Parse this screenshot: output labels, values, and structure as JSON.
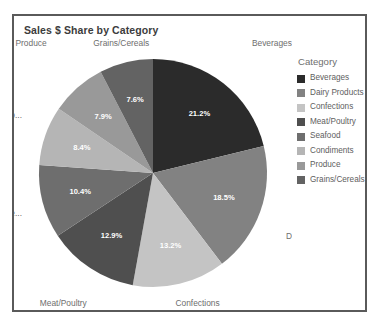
{
  "chart_title": "Sales $ Share by Category",
  "legend": {
    "title": "Category",
    "items": [
      {
        "label": "Beverages",
        "color": "#2b2b2b"
      },
      {
        "label": "Dairy Products",
        "color": "#828282"
      },
      {
        "label": "Confections",
        "color": "#c4c4c4"
      },
      {
        "label": "Meat/Poultry",
        "color": "#4f4f4f"
      },
      {
        "label": "Seafood",
        "color": "#6e6e6e"
      },
      {
        "label": "Condiments",
        "color": "#b5b5b5"
      },
      {
        "label": "Produce",
        "color": "#999999"
      },
      {
        "label": "Grains/Cereals",
        "color": "#636363"
      }
    ]
  },
  "outer_labels": [
    {
      "text": "Beverages"
    },
    {
      "text": "Da..."
    },
    {
      "text": "Confections"
    },
    {
      "text": "Meat/Poultry"
    },
    {
      "text": "Se..."
    },
    {
      "text": "Co..."
    },
    {
      "text": "Produce"
    },
    {
      "text": "Grains/Cereals"
    }
  ],
  "chart_data": {
    "type": "pie",
    "title": "Sales $ Share by Category",
    "legend_title": "Category",
    "legend_position": "right",
    "value_unit": "percent",
    "labels": [
      "Beverages",
      "Dairy Products",
      "Confections",
      "Meat/Poultry",
      "Seafood",
      "Condiments",
      "Produce",
      "Grains/Cereals"
    ],
    "values": [
      21.2,
      18.5,
      13.2,
      12.9,
      10.4,
      8.4,
      7.9,
      7.6
    ],
    "data_labels": [
      "21.2%",
      "18.5%",
      "13.2%",
      "12.9%",
      "10.4%",
      "8.4%",
      "7.9%",
      "7.6%"
    ],
    "colors": [
      "#2b2b2b",
      "#828282",
      "#c4c4c4",
      "#4f4f4f",
      "#6e6e6e",
      "#b5b5b5",
      "#999999",
      "#636363"
    ],
    "outer_label_text": [
      "Beverages",
      "Da...",
      "Confections",
      "Meat/Poultry",
      "Se...",
      "Co...",
      "Produce",
      "Grains/Cereals"
    ],
    "start_angle_deg": 0,
    "direction": "clockwise"
  }
}
